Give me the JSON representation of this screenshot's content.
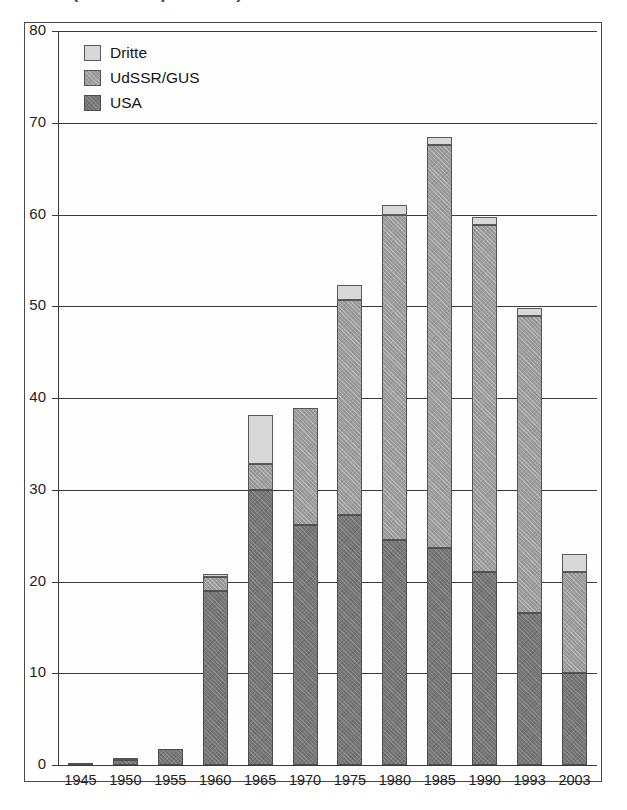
{
  "title": "(Weltweit pro Jahr)",
  "legend": {
    "position": "top-left-inside",
    "entries": [
      {
        "key": "dritte",
        "label": "Dritte",
        "color": "#d8d8d8"
      },
      {
        "key": "udssr",
        "label": "UdSSR/GUS",
        "color": "#9c9c9c"
      },
      {
        "key": "usa",
        "label": "USA",
        "color": "#777777"
      }
    ]
  },
  "chart_data": {
    "type": "bar",
    "stacked": true,
    "title": "(Weltweit pro Jahr)",
    "xlabel": "",
    "ylabel": "",
    "ylim": [
      0,
      80
    ],
    "ytick_step": 10,
    "yticks": [
      0,
      10,
      20,
      30,
      40,
      50,
      60,
      70,
      80
    ],
    "ytick_labels": [
      "0",
      "10",
      "20",
      "30",
      "40",
      "50",
      "60",
      "70",
      "80"
    ],
    "grid": true,
    "grid_axis": "y",
    "categories": [
      "1945",
      "1950",
      "1955",
      "1960",
      "1965",
      "1970",
      "1975",
      "1980",
      "1985",
      "1990",
      "1993",
      "2003"
    ],
    "series": [
      {
        "name": "USA",
        "color": "#777777",
        "values": [
          0.1,
          0.5,
          1.7,
          19.0,
          30.0,
          26.2,
          27.3,
          24.5,
          23.6,
          21.0,
          16.6,
          10.0
        ]
      },
      {
        "name": "UdSSR/GUS",
        "color": "#9c9c9c",
        "values": [
          0.0,
          0.2,
          0.0,
          1.5,
          2.8,
          12.7,
          23.4,
          35.5,
          44.0,
          37.9,
          32.3,
          11.0
        ]
      },
      {
        "name": "Dritte",
        "color": "#d8d8d8",
        "values": [
          0.0,
          0.0,
          0.0,
          0.3,
          5.4,
          0.0,
          1.6,
          1.0,
          0.9,
          0.8,
          0.9,
          2.0
        ]
      }
    ],
    "totals": [
      0.1,
      0.7,
      1.7,
      20.8,
      38.2,
      38.9,
      52.3,
      61.0,
      68.5,
      59.7,
      49.8,
      23.0
    ]
  }
}
